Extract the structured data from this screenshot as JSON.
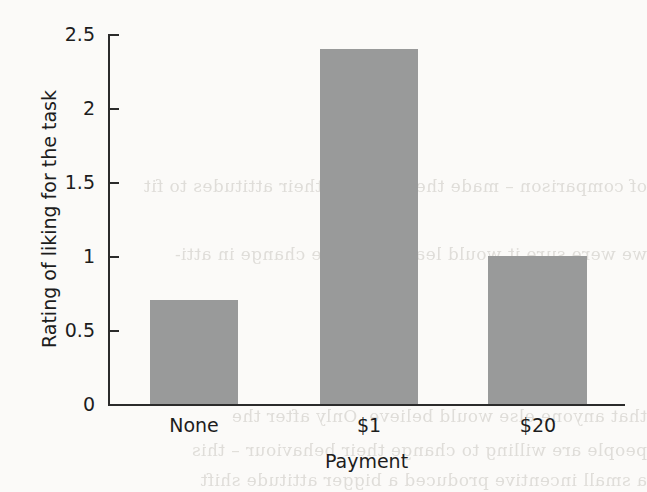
{
  "background": {
    "page_color": "#fbfaf8",
    "bleed_through_lines": [
      "of comparison – made them change their attitudes to fit",
      "we were sure it would lead to a large change in atti-",
      "that anyone else would believe. Only after the",
      "people are willing to change their behaviour – this",
      "a small incentive produced a bigger attitude shift"
    ]
  },
  "chart_data": {
    "type": "bar",
    "title": "",
    "categories": [
      "None",
      "$1",
      "$20"
    ],
    "values": [
      0.7,
      2.4,
      1.0
    ],
    "series": [
      {
        "name": "Rating of liking for the task",
        "values": [
          0.7,
          2.4,
          1.0
        ]
      }
    ],
    "xlabel": "Payment",
    "ylabel": "Rating of liking for the task",
    "ylim": [
      0,
      2.5
    ],
    "yticks": [
      0,
      0.5,
      1,
      1.5,
      2,
      2.5
    ],
    "ytick_labels": [
      "0",
      "0.5",
      "1",
      "1.5",
      "2",
      "2.5"
    ],
    "grid": false,
    "legend": false,
    "bar_color": "#999a9a",
    "axis_color": "#2b2b2b"
  }
}
